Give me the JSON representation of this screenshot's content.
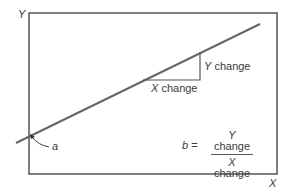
{
  "diagram": {
    "axes": {
      "y_label": "Y",
      "x_label": "X"
    },
    "triangle": {
      "x_label_var": "X",
      "x_label_text": " change",
      "y_label_var": "Y",
      "y_label_text": " change"
    },
    "intercept": {
      "label": "a"
    },
    "formula": {
      "lhs_var": "b",
      "equals": " =",
      "numerator_var": "Y",
      "numerator_text": " change",
      "denominator_var": "X",
      "denominator_text": " change"
    },
    "colors": {
      "frame": "#555555",
      "line": "#666666",
      "text": "#3a3a3a"
    }
  }
}
